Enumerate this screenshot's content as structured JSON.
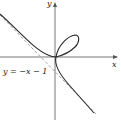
{
  "figure": {
    "axes": {
      "x_label": "x",
      "y_label": "y"
    },
    "asymptote": {
      "label": "y = −x − 1",
      "style": "dashed"
    },
    "curve": {
      "description": "folium loop in first quadrant, branches approaching asymptote in second and fourth quadrants"
    },
    "colors": {
      "curve": "#2a2a2a",
      "axis": "#555555",
      "asymptote": "#888888"
    }
  }
}
